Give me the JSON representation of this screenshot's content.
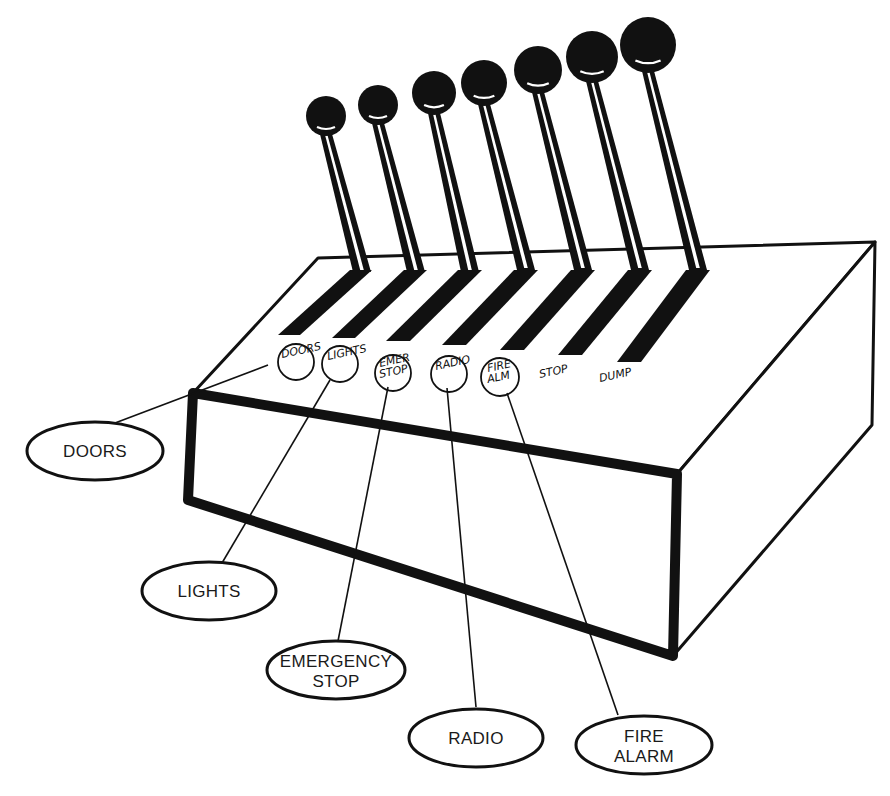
{
  "diagram": {
    "colors": {
      "ink": "#111111",
      "paper": "#ffffff"
    },
    "levers": [
      {
        "id": "lever-1",
        "handwritten_label": "DOORS"
      },
      {
        "id": "lever-2",
        "handwritten_label": "LIGHTS"
      },
      {
        "id": "lever-3",
        "handwritten_label": "EMER STOP"
      },
      {
        "id": "lever-4",
        "handwritten_label": "RADIO"
      },
      {
        "id": "lever-5",
        "handwritten_label": "FIRE ALM"
      },
      {
        "id": "lever-6",
        "handwritten_label": "STOP"
      },
      {
        "id": "lever-7",
        "handwritten_label": "DUMP"
      }
    ],
    "callouts": [
      {
        "id": "doors",
        "lines": [
          "DOORS"
        ]
      },
      {
        "id": "lights",
        "lines": [
          "LIGHTS"
        ]
      },
      {
        "id": "emergency-stop",
        "lines": [
          "EMERGENCY",
          "STOP"
        ]
      },
      {
        "id": "radio",
        "lines": [
          "RADIO"
        ]
      },
      {
        "id": "fire-alarm",
        "lines": [
          "FIRE",
          "ALARM"
        ]
      }
    ]
  }
}
